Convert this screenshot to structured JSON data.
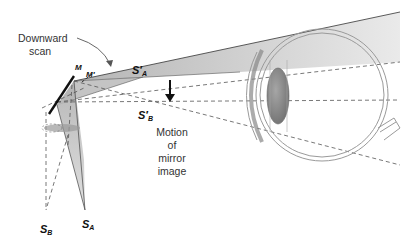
{
  "labels": {
    "downward_scan_line1": "Downward",
    "downward_scan_line2": "scan",
    "mirror_m": "M",
    "mirror_m_prime": "M′",
    "sa_prime": "S′",
    "sa_prime_sub": "A",
    "sb_prime": "S′",
    "sb_prime_sub": "B",
    "motion_line1": "Motion",
    "motion_line2": "of",
    "motion_line3": "mirror",
    "motion_line4": "image",
    "sb": "S",
    "sb_sub": "B",
    "sa": "S",
    "sa_sub": "A"
  },
  "colors": {
    "beam_fill": "#b8b8b8",
    "beam_dark": "#8a8a8a",
    "lens_fill": "#8c8c8c",
    "eye_stroke": "#9a9a9a",
    "line": "#555555"
  }
}
